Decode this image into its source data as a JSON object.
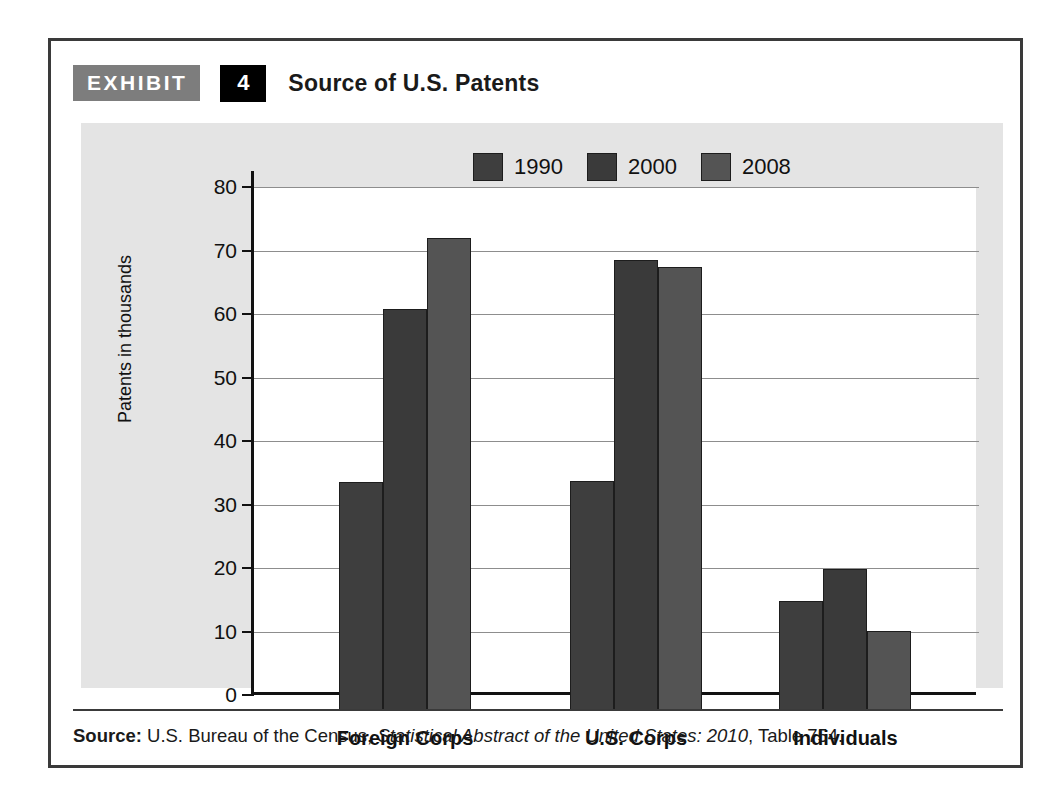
{
  "exhibit": {
    "tag": "EXHIBIT",
    "number": "4",
    "title": "Source of U.S. Patents"
  },
  "source": {
    "label": "Source:",
    "text_before_italic": " U.S. Bureau of the Census, ",
    "italic_text": "Statistical Abstract of the United States: 2010",
    "text_after_italic": ", Table 754."
  },
  "colors": {
    "series_1990": "#3e3e3e",
    "series_2000": "#3a3a3a",
    "series_2008": "#545454",
    "panel_background": "#e4e4e4",
    "plot_background": "#ffffff",
    "axis": "#111111",
    "gridline": "#8d8d8d",
    "tag_background": "#7d7d7d",
    "number_background": "#000000"
  },
  "chart_data": {
    "type": "bar",
    "title": "Source of U.S. Patents",
    "xlabel": "",
    "ylabel": "Patents in thousands",
    "categories": [
      "Foreign Corps",
      "U.S. Corps",
      "Individuals"
    ],
    "series": [
      {
        "name": "1990",
        "values": [
          36.1,
          36.2,
          17.3
        ]
      },
      {
        "name": "2000",
        "values": [
          63.3,
          71.0,
          22.3
        ]
      },
      {
        "name": "2008",
        "values": [
          74.5,
          69.9,
          12.6
        ]
      }
    ],
    "ylim": [
      0,
      80
    ],
    "yticks": [
      0,
      10,
      20,
      30,
      40,
      50,
      60,
      70,
      80
    ],
    "ytick_labels": [
      "0",
      "10",
      "20",
      "30",
      "40",
      "50",
      "60",
      "70",
      "80"
    ],
    "grid": true,
    "legend_position": "top-right",
    "units": "thousands of patents"
  }
}
